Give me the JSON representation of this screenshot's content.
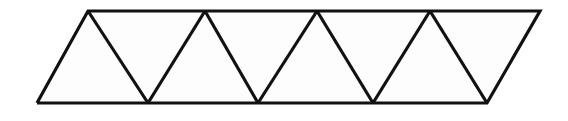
{
  "figure": {
    "name": "triangle-strip-parallelogram",
    "canvas": {
      "width": 568,
      "height": 121
    },
    "style": {
      "page_background": "#ffffff",
      "face_fill": "#fdfdfd",
      "stroke_color": "#111111",
      "stroke_width": 3.2,
      "line_join": "miter",
      "line_cap": "butt"
    },
    "geometry": {
      "top_y": 11,
      "bottom_y": 103,
      "top_vertices_x": [
        88,
        205,
        317,
        430,
        540
      ],
      "bottom_vertices_x": [
        37,
        148,
        258,
        373,
        487
      ],
      "top_left": [
        88,
        11
      ],
      "top_right": [
        540,
        11
      ],
      "bottom_left": [
        37,
        103
      ],
      "bottom_right": [
        487,
        103
      ],
      "triangle_count": 8,
      "upward_triangle_count": 4,
      "downward_triangle_count": 4
    },
    "faces": [
      {
        "id": "triangle-1-up",
        "orientation": "up",
        "points": "37,103 88,11 148,103"
      },
      {
        "id": "triangle-2-down",
        "orientation": "down",
        "points": "88,11 205,11 148,103"
      },
      {
        "id": "triangle-3-up",
        "orientation": "up",
        "points": "148,103 205,11 258,103"
      },
      {
        "id": "triangle-4-down",
        "orientation": "down",
        "points": "205,11 317,11 258,103"
      },
      {
        "id": "triangle-5-up",
        "orientation": "up",
        "points": "258,103 317,11 373,103"
      },
      {
        "id": "triangle-6-down",
        "orientation": "down",
        "points": "317,11 430,11 373,103"
      },
      {
        "id": "triangle-7-up",
        "orientation": "up",
        "points": "373,103 430,11 487,103"
      },
      {
        "id": "triangle-8-down",
        "orientation": "down",
        "points": "430,11 540,11 487,103"
      }
    ],
    "outline": "37,103 88,11 540,11 487,103 37,103",
    "internal_edges": [
      {
        "id": "edge-zigzag-1",
        "points": "88,11 148,103"
      },
      {
        "id": "edge-zigzag-2",
        "points": "148,103 205,11"
      },
      {
        "id": "edge-zigzag-3",
        "points": "205,11 258,103"
      },
      {
        "id": "edge-zigzag-4",
        "points": "258,103 317,11"
      },
      {
        "id": "edge-zigzag-5",
        "points": "317,11 373,103"
      },
      {
        "id": "edge-zigzag-6",
        "points": "373,103 430,11"
      },
      {
        "id": "edge-zigzag-7",
        "points": "430,11 487,103"
      }
    ]
  }
}
